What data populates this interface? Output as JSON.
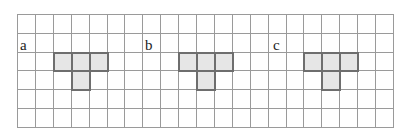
{
  "grid": {
    "columns": 21,
    "rows": 6,
    "cell_width": 17.9,
    "cell_height": 18.8,
    "line_color": "#9a9a9a",
    "shade_color": "#e6e6e6",
    "shape_border_color": "#6e6e6e"
  },
  "figures": [
    {
      "label": "a",
      "label_cell": [
        0,
        1
      ],
      "cells": [
        [
          2,
          2
        ],
        [
          3,
          2
        ],
        [
          4,
          2
        ],
        [
          3,
          3
        ]
      ]
    },
    {
      "label": "b",
      "label_cell": [
        7,
        1
      ],
      "cells": [
        [
          9,
          2
        ],
        [
          10,
          2
        ],
        [
          11,
          2
        ],
        [
          10,
          3
        ]
      ]
    },
    {
      "label": "c",
      "label_cell": [
        14,
        1
      ],
      "cells": [
        [
          16,
          2
        ],
        [
          17,
          2
        ],
        [
          18,
          2
        ],
        [
          17,
          3
        ]
      ]
    }
  ]
}
